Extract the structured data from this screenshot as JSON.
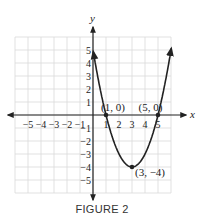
{
  "chart_data": {
    "type": "line",
    "title": "",
    "caption": "FIGURE 2",
    "xlabel": "x",
    "ylabel": "y",
    "xlim": [
      -6,
      6
    ],
    "ylim": [
      -6,
      6
    ],
    "grid": true,
    "x_ticks": [
      -5,
      -4,
      -3,
      -2,
      -1,
      1,
      2,
      3,
      4,
      5
    ],
    "x_tick_labels": [
      "−5",
      "−4",
      "−3",
      "−2",
      "−1",
      "1",
      "2",
      "3",
      "4",
      "5"
    ],
    "y_ticks": [
      5,
      4,
      3,
      2,
      1,
      -1,
      -2,
      -3,
      -4,
      -5
    ],
    "y_tick_labels": [
      "5",
      "4",
      "3",
      "2",
      "1",
      "−1",
      "−2",
      "−3",
      "−4",
      "−5"
    ],
    "series": [
      {
        "name": "parabola",
        "equation": "y = (x - 1)(x - 5) = x^2 - 6x + 5",
        "x": [
          0,
          0.5,
          1,
          1.5,
          2,
          2.5,
          3,
          3.5,
          4,
          4.5,
          5,
          5.5,
          6
        ],
        "values": [
          5,
          2.25,
          0,
          -1.75,
          -3,
          -3.75,
          -4,
          -3.75,
          -3,
          -1.75,
          0,
          2.25,
          5
        ]
      }
    ],
    "annotations": [
      {
        "label": "(1, 0)",
        "x": 1,
        "y": 0
      },
      {
        "label": "(5, 0)",
        "x": 5,
        "y": 0
      },
      {
        "label": "(3, −4)",
        "x": 3,
        "y": -4
      }
    ]
  },
  "figure": {
    "caption": "FIGURE 2"
  }
}
